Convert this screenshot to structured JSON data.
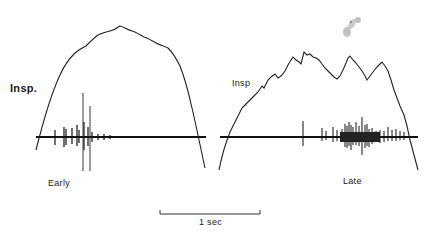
{
  "figure": {
    "panels": [
      {
        "id": "early",
        "trace_label": "Insp.",
        "caption": "Early",
        "description": "Smooth inspiratory phrenic/airflow envelope with EMG burst concentrated early in inspiration"
      },
      {
        "id": "late",
        "trace_label": "Insp",
        "caption": "Late",
        "description": "Jagged multi-peaked inspiratory envelope with EMG burst concentrated late in inspiration"
      }
    ],
    "scale_bar": {
      "label": "1 sec"
    }
  }
}
